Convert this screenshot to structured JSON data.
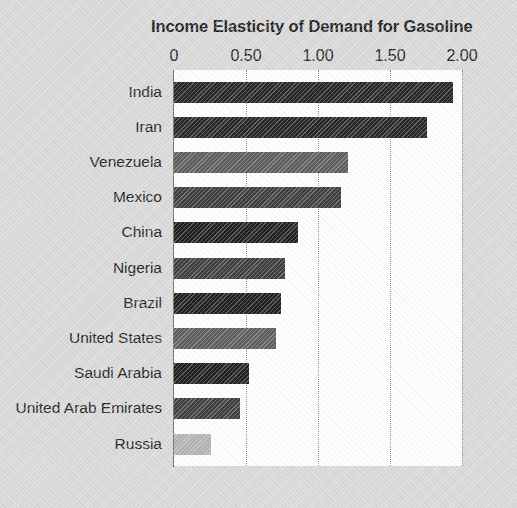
{
  "chart_data": {
    "type": "bar",
    "orientation": "horizontal",
    "title": "Income Elasticity of Demand for Gasoline",
    "xlabel": "",
    "ylabel": "",
    "xlim": [
      0,
      2.0
    ],
    "xticks": [
      "0",
      "0.50",
      "1.00",
      "1.50",
      "2.00"
    ],
    "xtick_values": [
      0,
      0.5,
      1.0,
      1.5,
      2.0
    ],
    "grid": "vertical-dotted",
    "legend": "none",
    "categories": [
      "India",
      "Iran",
      "Venezuela",
      "Mexico",
      "China",
      "Nigeria",
      "Brazil",
      "United States",
      "Saudi Arabia",
      "United Arab Emirates",
      "Russia"
    ],
    "values": [
      1.94,
      1.76,
      1.21,
      1.16,
      0.86,
      0.77,
      0.74,
      0.71,
      0.52,
      0.46,
      0.26
    ],
    "bar_colors": [
      "#262626",
      "#262626",
      "#5c5c5c",
      "#3d3d3d",
      "#1f1f1f",
      "#3d3d3d",
      "#1f1f1f",
      "#5c5c5c",
      "#1f1f1f",
      "#3d3d3d",
      "#b2b2b2"
    ]
  },
  "colors": {
    "background": "#d8d8d8",
    "plot_background": "#fdfdfd",
    "axis": "#6e6e6e",
    "gridline": "#8a8a8a",
    "text": "#1c1c1c"
  }
}
